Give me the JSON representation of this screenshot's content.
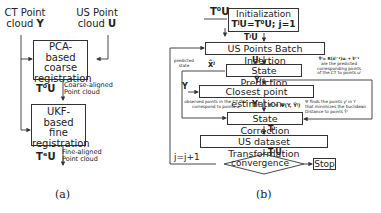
{
  "panel_a": {
    "inputs": {
      "ct": {
        "line1": "CT Point",
        "line2": "cloud",
        "var": "Y"
      },
      "us": {
        "line1": "US Point",
        "line2": "cloud",
        "var": "U"
      }
    },
    "pca_box": {
      "line1": "PCA-based",
      "line2": "coarse",
      "line3": "registration"
    },
    "coarse_output": {
      "var": "T⁰U",
      "line1": "Coarse-aligned",
      "line2": "Point cloud"
    },
    "ukf_box": {
      "line1": "UKF-based",
      "line2": "fine",
      "line3": "registration"
    },
    "fine_output": {
      "var": "TᵉU",
      "line1": "Fine-aligned",
      "line2": "Point cloud"
    },
    "caption": "(a)"
  },
  "panel_b": {
    "init_input": "T⁰U",
    "init_box": {
      "line1": "Initialization",
      "line2": "TʲU=T⁰U; j=1"
    },
    "after_init": "TʲU",
    "batch_box": "US Points Batch Insertion",
    "batch_out": "Uʲ",
    "predicted_state_label": {
      "line1": "predicted",
      "line2": "state"
    },
    "predicted_state_var": "x̂ʲ",
    "state_pred_box": "State Prediction",
    "pred_note": {
      "formula": "Ŷʲ= R(x̂ʲ⁻¹)uᵢ + t̂ʲ⁻¹",
      "line1": "are the predicted",
      "line2": "corresponding points",
      "line3": "of the CT to points uʲ"
    },
    "pred_out": "Ŷʲ",
    "ct_input": "Y",
    "closest_box": "Closest point estimation",
    "observed_note": {
      "line1": "observed points in the CT that",
      "line2": "correspond to points uʲ"
    },
    "closest_out": "Yʲ",
    "closest_formula": "Yʲ = Ψ(Y, Ŷʲ)",
    "psi_note": {
      "line1": "Ψ finds the points yʲ in Y",
      "line2": "that minimizes the Euclidean",
      "line3": "Distance to points Ŷʲ"
    },
    "state_corr_box": "State Correction",
    "corr_out": "Tʲ",
    "transform_box": "US dataset Transformation",
    "transform_out": "TʲU",
    "loop_label": "j=j+1",
    "convergence": "convergence",
    "stop": "Stop",
    "caption": "(b)"
  }
}
